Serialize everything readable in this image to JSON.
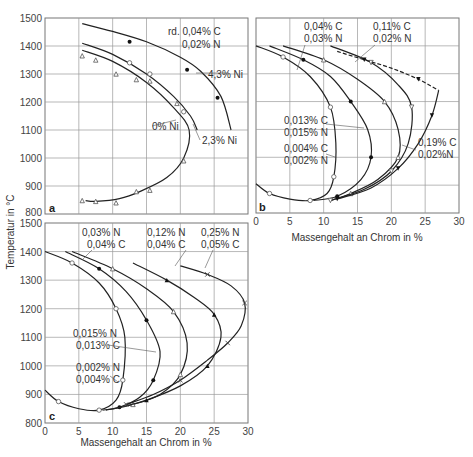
{
  "chart_data": [
    {
      "panel": "a",
      "type": "line",
      "xlabel": "",
      "ylabel": "Temperatur in °C",
      "xlim": [
        0,
        30
      ],
      "ylim": [
        800,
        1500
      ],
      "xticks": [
        0,
        5,
        10,
        15,
        20,
        25,
        30
      ],
      "yticks": [
        800,
        900,
        1000,
        1100,
        1200,
        1300,
        1400,
        1500
      ],
      "grid": true,
      "annotations": [
        "rd. 0,04% C",
        "0,02% N",
        "4,3% Ni",
        "2,3% Ni",
        "0% Ni"
      ],
      "series": [
        {
          "name": "4,3% Ni",
          "style": "solid",
          "marker": "filled-circle",
          "curve": [
            [
              5.5,
              1480
            ],
            [
              10,
              1452
            ],
            [
              15,
              1415
            ],
            [
              20,
              1360
            ],
            [
              23,
              1310
            ],
            [
              26,
              1220
            ],
            [
              27.5,
              1100
            ]
          ],
          "points": [
            [
              12.5,
              1415
            ],
            [
              21,
              1315
            ],
            [
              25.5,
              1215
            ]
          ]
        },
        {
          "name": "2,3% Ni",
          "style": "solid",
          "marker": "open-circle",
          "curve": [
            [
              5.5,
              1410
            ],
            [
              10,
              1370
            ],
            [
              15,
              1300
            ],
            [
              19,
              1220
            ],
            [
              21.5,
              1150
            ],
            [
              22.5,
              1100
            ]
          ],
          "points": [
            [
              12.5,
              1340
            ],
            [
              15.5,
              1300
            ],
            [
              20.5,
              1165
            ]
          ]
        },
        {
          "name": "0% Ni",
          "style": "solid",
          "marker": "open-triangle",
          "curve": [
            [
              5.5,
              1385
            ],
            [
              10,
              1345
            ],
            [
              15,
              1270
            ],
            [
              19,
              1180
            ],
            [
              21.3,
              1100
            ],
            [
              20.5,
              1000
            ],
            [
              18,
              930
            ],
            [
              14,
              880
            ],
            [
              11,
              855
            ],
            [
              7.5,
              845
            ],
            [
              6,
              848
            ]
          ],
          "points": [
            [
              5.5,
              1365
            ],
            [
              7.5,
              1350
            ],
            [
              10.5,
              1300
            ],
            [
              13.5,
              1280
            ],
            [
              15.5,
              1275
            ],
            [
              19.5,
              1195
            ],
            [
              20.5,
              990
            ],
            [
              13.5,
              880
            ],
            [
              15.5,
              885
            ],
            [
              5.5,
              848
            ],
            [
              7.5,
              845
            ],
            [
              10.5,
              840
            ]
          ]
        }
      ]
    },
    {
      "panel": "b",
      "type": "line",
      "xlabel": "Massengehalt an Chrom in %",
      "ylabel": "",
      "xlim": [
        0,
        30
      ],
      "ylim": [
        800,
        1500
      ],
      "xticks": [
        0,
        5,
        10,
        15,
        20,
        25,
        30
      ],
      "yticks": [
        800,
        900,
        1000,
        1100,
        1200,
        1300,
        1400,
        1500
      ],
      "grid": true,
      "annotations": [
        "0,04% C",
        "0,03% N",
        "0,11% C",
        "0,02% N",
        "0,013% C",
        "0,015% N",
        "0,004% C",
        "0,002% N",
        "0,19% C",
        "0,02% N"
      ],
      "series": [
        {
          "name": "0,004% C / 0,002% N",
          "style": "solid",
          "marker": "open-circle",
          "curve": [
            [
              0,
              1400
            ],
            [
              4,
              1360
            ],
            [
              8,
              1290
            ],
            [
              11,
              1180
            ],
            [
              11.8,
              1050
            ],
            [
              11.5,
              930
            ],
            [
              10.5,
              870
            ],
            [
              8,
              845
            ],
            [
              5,
              850
            ],
            [
              2,
              870
            ],
            [
              0,
              905
            ]
          ]
        },
        {
          "name": "0,013% C / 0,015% N",
          "style": "solid",
          "marker": "filled-circle",
          "curve": [
            [
              2,
              1400
            ],
            [
              7,
              1350
            ],
            [
              11,
              1290
            ],
            [
              14,
              1200
            ],
            [
              16.5,
              1100
            ],
            [
              17,
              1000
            ],
            [
              15.5,
              920
            ],
            [
              12,
              860
            ],
            [
              8.5,
              845
            ]
          ]
        },
        {
          "name": "0,04% C / 0,03% N",
          "style": "solid",
          "marker": "open-triangle",
          "curve": [
            [
              4,
              1400
            ],
            [
              10,
              1350
            ],
            [
              15,
              1280
            ],
            [
              19,
              1200
            ],
            [
              21,
              1100
            ],
            [
              21,
              1000
            ],
            [
              18,
              920
            ],
            [
              14,
              870
            ],
            [
              11,
              845
            ]
          ]
        },
        {
          "name": "0,11% C / 0,02% N",
          "style": "solid",
          "marker": "open-triangle-down",
          "curve": [
            [
              11,
              1400
            ],
            [
              17,
              1340
            ],
            [
              21,
              1260
            ],
            [
              23,
              1180
            ],
            [
              22.5,
              1050
            ],
            [
              20,
              950
            ],
            [
              16,
              885
            ],
            [
              11,
              845
            ]
          ]
        },
        {
          "name": "0,19% C / 0,02% N",
          "style": "dashed-upper",
          "marker": "filled-triangle-down",
          "curve": [
            [
              12,
              1380
            ],
            [
              16,
              1350
            ],
            [
              20,
              1320
            ],
            [
              24,
              1280
            ],
            [
              27,
              1240
            ],
            [
              26,
              1150
            ],
            [
              24,
              1050
            ],
            [
              21,
              960
            ],
            [
              17,
              890
            ],
            [
              12,
              850
            ]
          ]
        }
      ]
    },
    {
      "panel": "c",
      "type": "line",
      "xlabel": "Massengehalt an Chrom in %",
      "ylabel": "Temperatur in °C",
      "xlim": [
        0,
        30
      ],
      "ylim": [
        800,
        1500
      ],
      "xticks": [
        0,
        5,
        10,
        15,
        20,
        25,
        30
      ],
      "yticks": [
        800,
        900,
        1000,
        1100,
        1200,
        1300,
        1400,
        1500
      ],
      "grid": true,
      "annotations": [
        "0,03% N",
        "0,04% C",
        "0,12% N",
        "0,04% C",
        "0,25% N",
        "0,05% C",
        "0,015% N",
        "0,013% C",
        "0,002% N",
        "0,004% C"
      ],
      "series": [
        {
          "name": "0,002% N / 0,004% C",
          "style": "solid",
          "marker": "open-circle",
          "curve": [
            [
              0,
              1400
            ],
            [
              4,
              1360
            ],
            [
              8,
              1290
            ],
            [
              10.5,
              1200
            ],
            [
              11.8,
              1100
            ],
            [
              11.5,
              950
            ],
            [
              10.5,
              880
            ],
            [
              8,
              845
            ],
            [
              5,
              850
            ],
            [
              2,
              875
            ],
            [
              0,
              915
            ]
          ]
        },
        {
          "name": "0,015% N / 0,013% C",
          "style": "solid",
          "marker": "filled-circle",
          "curve": [
            [
              3,
              1400
            ],
            [
              8,
              1340
            ],
            [
              12,
              1260
            ],
            [
              15,
              1160
            ],
            [
              17,
              1050
            ],
            [
              16,
              950
            ],
            [
              14,
              890
            ],
            [
              11,
              855
            ],
            [
              8.5,
              845
            ]
          ]
        },
        {
          "name": "0,03% N / 0,04% C",
          "style": "solid",
          "marker": "open-triangle",
          "curve": [
            [
              4,
              1400
            ],
            [
              10,
              1340
            ],
            [
              15,
              1270
            ],
            [
              19,
              1190
            ],
            [
              21,
              1080
            ],
            [
              20,
              970
            ],
            [
              17,
              900
            ],
            [
              13,
              865
            ],
            [
              9,
              845
            ]
          ]
        },
        {
          "name": "0,12% N / 0,04% C",
          "style": "solid",
          "marker": "filled-triangle",
          "curve": [
            [
              13,
              1360
            ],
            [
              18,
              1300
            ],
            [
              22,
              1240
            ],
            [
              25,
              1180
            ],
            [
              26,
              1100
            ],
            [
              24,
              1000
            ],
            [
              20,
              930
            ],
            [
              15,
              880
            ],
            [
              12,
              860
            ]
          ]
        },
        {
          "name": "0,25% N / 0,05% C",
          "style": "solid",
          "marker": "cross",
          "curve": [
            [
              20,
              1350
            ],
            [
              24,
              1320
            ],
            [
              27.5,
              1280
            ],
            [
              29.5,
              1220
            ],
            [
              29,
              1140
            ],
            [
              27,
              1080
            ],
            [
              24,
              1020
            ],
            [
              20,
              950
            ],
            [
              16,
              900
            ],
            [
              12,
              865
            ]
          ]
        }
      ]
    }
  ],
  "panels": {
    "a": {
      "letter": "a",
      "labels": {
        "rd": "rd. 0,04% C",
        "n": "0,02% N",
        "ni43": "4,3% Ni",
        "ni23": "2,3% Ni",
        "ni0": "0% Ni"
      }
    },
    "b": {
      "letter": "b",
      "labels": {
        "l1a": "0,04% C",
        "l1b": "0,03% N",
        "l2a": "0,11% C",
        "l2b": "0,02% N",
        "l3a": "0,013% C",
        "l3b": "0,015% N",
        "l4a": "0,004% C",
        "l4b": "0,002% N",
        "l5a": "0,19% C",
        "l5b": "0,02%N"
      }
    },
    "c": {
      "letter": "c",
      "labels": {
        "l1a": "0,03% N",
        "l1b": "0,04% C",
        "l2a": "0,12% N",
        "l2b": "0,04% C",
        "l3a": "0,25% N",
        "l3b": "0,05% C",
        "l4a": "0,015% N",
        "l4b": "0,013% C",
        "l5a": "0,002% N",
        "l5b": "0,004% C"
      }
    }
  },
  "axes": {
    "ylabel": "Temperatur in °C",
    "xlabel": "Massengehalt an Chrom in %",
    "yticks": [
      "800",
      "900",
      "1000",
      "1100",
      "1200",
      "1300",
      "1400",
      "1500"
    ],
    "xticks": [
      "0",
      "5",
      "10",
      "15",
      "20",
      "25",
      "30"
    ]
  }
}
